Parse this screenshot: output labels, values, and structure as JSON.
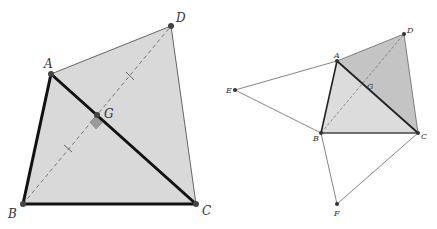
{
  "figures": [
    {
      "id": "left",
      "description": "Quadrilateral ABCD with diagonals AC and BD perpendicular at G; BD dashed with equal-length tick marks",
      "labels": {
        "A": "A",
        "B": "B",
        "C": "C",
        "D": "D",
        "G": "G"
      }
    },
    {
      "id": "right",
      "description": "Quadrilateral ABCD with diagonals meeting at G, plus external triangles ABE and BCF",
      "labels": {
        "A": "A",
        "B": "B",
        "C": "C",
        "D": "D",
        "E": "E",
        "F": "F",
        "G": "G"
      }
    }
  ],
  "colors": {
    "fill_light": "#d9d9d9",
    "fill_dark": "#c4c4c4",
    "stroke": "#111111",
    "thin_stroke": "#555555",
    "point": "#444444",
    "right_angle": "#9a9a9a"
  }
}
